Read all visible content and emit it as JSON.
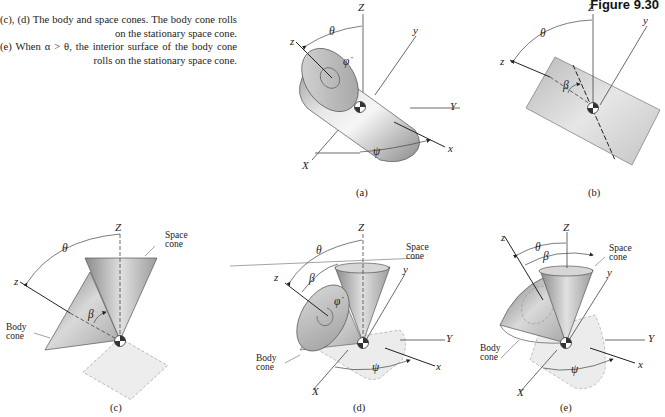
{
  "figure": {
    "title": "Figure 9.30",
    "caption_lines": [
      "(c), (d) The body and space cones. The body cone rolls on the stationary space cone.",
      "(e) When α > θ, the interior surface of the body cone rolls on the stationary space cone."
    ]
  },
  "panels": {
    "a": {
      "sublabel": "(a)",
      "labels": {
        "Z": "Z",
        "z": "z",
        "y": "y",
        "Y": "Y",
        "X": "X",
        "x": "x",
        "theta": "θ",
        "psi": "ψ",
        "phidot": "φ̇"
      },
      "shape": "cylinder"
    },
    "b": {
      "sublabel": "(b)",
      "labels": {
        "Z": "Z",
        "z": "z",
        "y": "y",
        "theta": "θ",
        "beta": "β"
      },
      "shape": "cylinder-side-view"
    },
    "c": {
      "sublabel": "(c)",
      "labels": {
        "Z": "Z",
        "z": "z",
        "theta": "θ",
        "beta": "β",
        "space_cone": "Space\ncone",
        "body_cone": "Body\ncone"
      },
      "space_cone_l1": "Space",
      "space_cone_l2": "cone",
      "body_cone_l1": "Body",
      "body_cone_l2": "cone",
      "shape": "cones-side-view"
    },
    "d": {
      "sublabel": "(d)",
      "labels": {
        "Z": "Z",
        "z": "z",
        "y": "y",
        "Y": "Y",
        "X": "X",
        "x": "x",
        "theta": "θ",
        "beta": "β",
        "psi": "ψ",
        "phidot": "φ̇"
      },
      "space_cone_l1": "Space",
      "space_cone_l2": "cone",
      "body_cone_l1": "Body",
      "body_cone_l2": "cone",
      "shape": "body-cone-rolling-outside"
    },
    "e": {
      "sublabel": "(e)",
      "labels": {
        "Z": "Z",
        "z": "z",
        "y": "y",
        "Y": "Y",
        "X": "X",
        "x": "x",
        "theta": "θ",
        "beta": "β",
        "psi": "ψ"
      },
      "space_cone_l1": "Space",
      "space_cone_l2": "cone",
      "body_cone_l1": "Body",
      "body_cone_l2": "cone",
      "shape": "body-cone-rolling-inside"
    }
  },
  "colors": {
    "line": "#333333",
    "shade_dark": "#8a8a8a",
    "shade_mid": "#bdbdbd",
    "shade_light": "#ececec",
    "ghost": "#e4e4e4",
    "ghost_edge": "#9a9a9a"
  }
}
